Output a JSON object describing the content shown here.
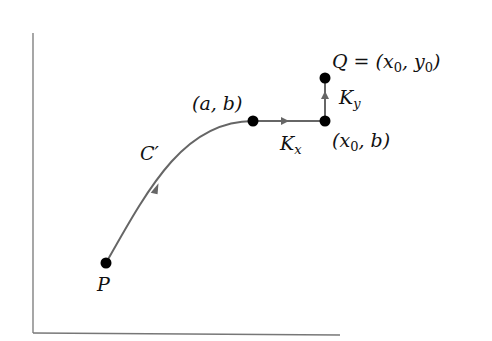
{
  "diagram": {
    "colors": {
      "axis": "#777777",
      "curve": "#666666",
      "point": "#000000",
      "text": "#111111"
    },
    "points": [
      {
        "id": "P",
        "label": "P",
        "x": 106,
        "y": 263
      },
      {
        "id": "ab",
        "label": "(a, b)",
        "x": 253,
        "y": 121
      },
      {
        "id": "x0b",
        "label": "(x0, b)",
        "x": 325,
        "y": 121
      },
      {
        "id": "Q",
        "label": "Q = (x0, y0)",
        "x": 325,
        "y": 78
      }
    ],
    "paths": [
      {
        "id": "C-prime",
        "label": "C′"
      },
      {
        "id": "Kx",
        "label": "K",
        "sub": "x"
      },
      {
        "id": "Ky",
        "label": "K",
        "sub": "y"
      }
    ],
    "labels": {
      "P": "P",
      "C": "C′",
      "ab": "(a, b)",
      "Kx_main": "K",
      "Kx_sub": "x",
      "Ky_main": "K",
      "Ky_sub": "y",
      "x0b_open": "(x",
      "x0b_sub": "0",
      "x0b_close": ", b)",
      "Q_main": "Q = (x",
      "Q_sub1": "0",
      "Q_mid": ", y",
      "Q_sub2": "0",
      "Q_close": ")"
    }
  }
}
